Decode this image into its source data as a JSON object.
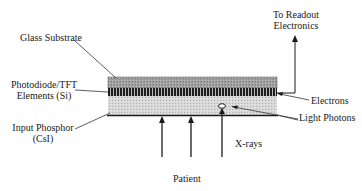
{
  "diagram": {
    "type": "flat-panel detector cross-section",
    "layers": [
      {
        "name": "Glass Substrate",
        "fill": "#9a9a9a",
        "pattern": "dotted"
      },
      {
        "name": "Photodiode/TFT Elements (Si)",
        "fill": "#2a2a2a",
        "pattern": "vertical-stripes"
      },
      {
        "name": "Input Phosphor (CsI)",
        "fill": "#d4d4d4",
        "pattern": "dotted-light"
      }
    ]
  },
  "labels": {
    "glass_substrate": "Glass Substrate",
    "photodiode_line1": "Photodiode/TFT",
    "photodiode_line2": "Elements (Si)",
    "phosphor_line1": "Input Phosphor",
    "phosphor_line2": "(CsI)",
    "readout_line1": "To Readout",
    "readout_line2": "Electronics",
    "electrons": "Electrons",
    "light_photons": "Light Photons",
    "xrays": "X-rays",
    "patient": "Patient"
  },
  "colors": {
    "line": "#1a1a1a",
    "glass": "#9a9a9a",
    "photodiode": "#2a2a2a",
    "phosphor": "#d4d4d4"
  }
}
